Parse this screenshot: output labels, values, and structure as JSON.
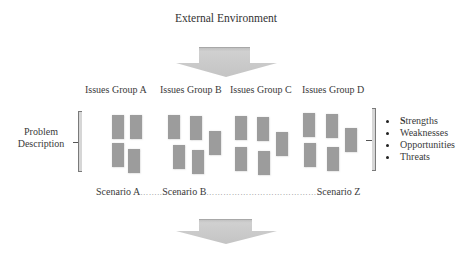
{
  "diagram": {
    "title": "External Environment",
    "top_arrow": {
      "direction": "down",
      "color": "#c8c8c8"
    },
    "bottom_arrow": {
      "direction": "down",
      "color": "#c8c8c8"
    },
    "left_bracket": {
      "label_line1": "Problem",
      "label_line2": "Description"
    },
    "groups": [
      {
        "label": "Issues Group A",
        "cards": 4
      },
      {
        "label": "Issues Group B",
        "cards": 5
      },
      {
        "label": "Issues Group C",
        "cards": 5
      },
      {
        "label": "Issues Group D",
        "cards": 5
      }
    ],
    "swot": {
      "items": [
        {
          "first": "S",
          "rest": "trengths"
        },
        {
          "first": "",
          "rest": "Weaknesses"
        },
        {
          "first": "",
          "rest": "Opportunities"
        },
        {
          "first": "",
          "rest": "Threats"
        }
      ]
    },
    "scenarios": {
      "a": "Scenario A",
      "dots1": "……..",
      "b": "Scenario B",
      "dots2": "…………………………………",
      "z": "Scenario Z"
    },
    "colors": {
      "card": "#9c9c9c",
      "arrow": "#c8c8c8",
      "text": "#3a3a3a"
    }
  }
}
